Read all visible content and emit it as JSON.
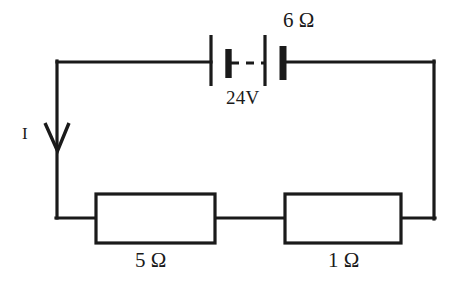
{
  "diagram": {
    "type": "schematic",
    "background_color": "#ffffff",
    "stroke_color": "#1a1a1a",
    "canvas": {
      "width": 458,
      "height": 288
    }
  },
  "labels": {
    "source_internal_resistance": "6 Ω",
    "source_voltage": "24V",
    "current": "I",
    "resistor_left": "5 Ω",
    "resistor_right": "1 Ω"
  },
  "components": [
    {
      "id": "battery",
      "name": "battery-symbol",
      "kind": "dc-voltage-source",
      "value": "24V",
      "associated_label": "6 Ω",
      "cells": 2,
      "position": {
        "x": 211,
        "y": 62
      }
    },
    {
      "id": "resistor-5-ohm",
      "name": "resistor-box-5-ohm",
      "kind": "resistor",
      "value": "5 Ω",
      "position": {
        "x": 96,
        "y": 194,
        "width": 119,
        "height": 49
      }
    },
    {
      "id": "resistor-1-ohm",
      "name": "resistor-box-1-ohm",
      "kind": "resistor",
      "value": "1 Ω",
      "position": {
        "x": 285,
        "y": 194,
        "width": 116,
        "height": 49
      }
    },
    {
      "id": "current-arrow",
      "name": "current-direction-arrow",
      "kind": "arrow",
      "direction": "down",
      "label": "I",
      "position": {
        "x": 57,
        "y": 150
      }
    }
  ],
  "wires": {
    "top_rail_y": 62,
    "bottom_rail_y": 218,
    "left_rail_x": 57,
    "right_rail_x": 434
  }
}
